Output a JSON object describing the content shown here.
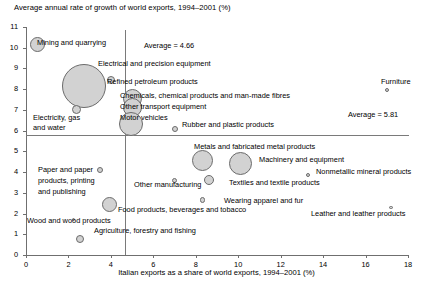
{
  "chart_data": {
    "type": "scatter",
    "title": "Average annual rate of growth of world exports, 1994–2001 (%)",
    "xlabel": "Italian exports as a share of world exports, 1994–2001 (%)",
    "ylabel": "Average annual rate of growth of world exports, 1994–2001 (%)",
    "xlim": [
      0,
      18
    ],
    "ylim": [
      0,
      11
    ],
    "xticks": [
      "0",
      "2",
      "4",
      "6",
      "8",
      "10",
      "12",
      "14",
      "16",
      "18"
    ],
    "yticks": [
      "0",
      "1",
      "2",
      "3",
      "4",
      "5",
      "6",
      "7",
      "8",
      "9",
      "10",
      "11"
    ],
    "grid": false,
    "legend": "none",
    "bubble_note": "Bubble area encodes share of total Italian exports",
    "reference_lines": [
      {
        "orientation": "vertical",
        "value": 4.66,
        "label": "Average = 4.66"
      },
      {
        "orientation": "horizontal",
        "value": 5.81,
        "label": "Average = 5.81"
      }
    ],
    "points": [
      {
        "label": "Mining and quarrying",
        "x": 0.55,
        "y": 10.15,
        "size": 7.5
      },
      {
        "label": "Electrical and precision equipment",
        "x": 2.75,
        "y": 8.15,
        "size": 22.0
      },
      {
        "label": "Refined petroleum products",
        "x": 4.0,
        "y": 8.45,
        "size": 4.0
      },
      {
        "label": "Chemicals, chemical products and man-made fibres",
        "x": 5.0,
        "y": 7.55,
        "size": 9.5
      },
      {
        "label": "Other transport equipment",
        "x": 5.0,
        "y": 7.1,
        "size": 9.5
      },
      {
        "label": "Motor vehicles",
        "x": 4.95,
        "y": 6.3,
        "size": 12.0
      },
      {
        "label": "Electricity, gas and water",
        "x": 2.4,
        "y": 7.0,
        "size": 4.5
      },
      {
        "label": "Furniture",
        "x": 17.0,
        "y": 7.95,
        "size": 2.0
      },
      {
        "label": "Rubber and plastic products",
        "x": 7.0,
        "y": 6.1,
        "size": 3.0
      },
      {
        "label": "Metals and fabricated metal products",
        "x": 8.3,
        "y": 4.55,
        "size": 10.5
      },
      {
        "label": "Machinery and equipment",
        "x": 10.1,
        "y": 4.4,
        "size": 11.5
      },
      {
        "label": "Nonmetallic mineral products",
        "x": 13.3,
        "y": 3.85,
        "size": 2.0
      },
      {
        "label": "Other manufacturing",
        "x": 7.0,
        "y": 3.6,
        "size": 2.6
      },
      {
        "label": "Textiles and textile products",
        "x": 8.6,
        "y": 3.6,
        "size": 5.0
      },
      {
        "label": "Wearing apparel and fur",
        "x": 8.3,
        "y": 2.65,
        "size": 2.6
      },
      {
        "label": "Leather and leather products",
        "x": 17.2,
        "y": 2.3,
        "size": 1.7
      },
      {
        "label": "Paper and paper products, printing and publishing",
        "x": 3.5,
        "y": 4.1,
        "size": 3.2
      },
      {
        "label": "Food products, beverages and tobacco",
        "x": 3.95,
        "y": 2.45,
        "size": 7.5
      },
      {
        "label": "Wood and wood products",
        "x": 2.25,
        "y": 1.7,
        "size": 1.5
      },
      {
        "label": "Agriculture, forestry and fishing",
        "x": 2.55,
        "y": 0.75,
        "size": 4.0
      }
    ],
    "point_labels": [
      {
        "text": "Mining and quarrying",
        "left": 37,
        "top": 38,
        "align": "left"
      },
      {
        "text": "Average = 4.66",
        "left": 144,
        "top": 41,
        "align": "left"
      },
      {
        "text": "Electrical and precision equipment",
        "left": 98,
        "top": 59,
        "align": "left"
      },
      {
        "text": "Refined petroleum products",
        "left": 107,
        "top": 77,
        "align": "left"
      },
      {
        "text": "Furniture",
        "left": 381,
        "top": 77,
        "align": "left"
      },
      {
        "text": "Chemicals, chemical products and man-made fibres",
        "left": 120,
        "top": 91,
        "align": "left"
      },
      {
        "text": "Other transport equipment",
        "left": 120,
        "top": 102,
        "align": "left"
      },
      {
        "text": "Motor vehicles",
        "left": 120,
        "top": 113,
        "align": "left"
      },
      {
        "text": "Electricity, gas",
        "left": 33,
        "top": 113,
        "align": "left"
      },
      {
        "text": "and water",
        "left": 33,
        "top": 123,
        "align": "left"
      },
      {
        "text": "Average = 5.81",
        "left": 348,
        "top": 110,
        "align": "left"
      },
      {
        "text": "Rubber and plastic products",
        "left": 182,
        "top": 120,
        "align": "left"
      },
      {
        "text": "Metals and fabricated metal products",
        "left": 194,
        "top": 142,
        "align": "left"
      },
      {
        "text": "Machinery and equipment",
        "left": 259,
        "top": 155,
        "align": "left"
      },
      {
        "text": "Nonmetallic mineral products",
        "left": 316,
        "top": 167,
        "align": "left"
      },
      {
        "text": "Paper and paper",
        "left": 38,
        "top": 165,
        "align": "left"
      },
      {
        "text": "products, printing",
        "left": 38,
        "top": 176,
        "align": "left"
      },
      {
        "text": "and publishing",
        "left": 38,
        "top": 187,
        "align": "left"
      },
      {
        "text": "Other manufacturing",
        "left": 134,
        "top": 180,
        "align": "left"
      },
      {
        "text": "Textiles and textile products",
        "left": 229,
        "top": 178,
        "align": "left"
      },
      {
        "text": "Wearing apparel and fur",
        "left": 224,
        "top": 196,
        "align": "left"
      },
      {
        "text": "Food products, beverages and tobacco",
        "left": 118,
        "top": 205,
        "align": "left"
      },
      {
        "text": "Leather and leather products",
        "left": 311,
        "top": 209,
        "align": "left"
      },
      {
        "text": "Wood and wood products",
        "left": 27,
        "top": 216,
        "align": "left"
      },
      {
        "text": "Agriculture, forestry and fishing",
        "left": 94,
        "top": 226,
        "align": "left"
      }
    ]
  },
  "style": {
    "bubble_fill": "#d2d2d2",
    "bubble_stroke": "#6b6b6b",
    "axis_color": "#6f6f6f",
    "reference_line_color": "#7a7a7a",
    "text_color": "#000000"
  }
}
